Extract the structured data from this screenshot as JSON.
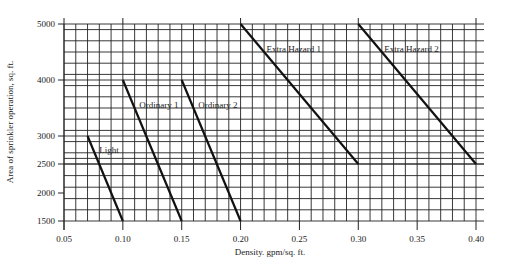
{
  "chart_data": {
    "type": "line",
    "title": "",
    "xlabel": "Density. gpm/sq. ft.",
    "ylabel": "Area of sprinkler operation, sq. ft.",
    "xlim": [
      0.05,
      0.4
    ],
    "ylim": [
      1500,
      5000
    ],
    "x_ticks": [
      "0.05",
      "0.10",
      "0.15",
      "0.20",
      "0.25",
      "0.30",
      "0.35",
      "0.40"
    ],
    "y_ticks": [
      "1500",
      "2000",
      "2500",
      "3000",
      "4000",
      "5000"
    ],
    "grid": true,
    "legend": "none (inline labels)",
    "series": [
      {
        "name": "Light",
        "points": [
          [
            0.07,
            3000
          ],
          [
            0.1,
            1500
          ]
        ],
        "label_at": [
          0.08,
          2700
        ]
      },
      {
        "name": "Ordinary 1",
        "points": [
          [
            0.1,
            4000
          ],
          [
            0.15,
            1500
          ]
        ],
        "label_at": [
          0.114,
          3500
        ]
      },
      {
        "name": "Ordinary 2",
        "points": [
          [
            0.15,
            4000
          ],
          [
            0.2,
            1500
          ]
        ],
        "label_at": [
          0.164,
          3500
        ]
      },
      {
        "name": "Extra Hazard 1",
        "points": [
          [
            0.2,
            5000
          ],
          [
            0.3,
            2500
          ]
        ],
        "label_at": [
          0.222,
          4500
        ]
      },
      {
        "name": "Extra Hazard 2",
        "points": [
          [
            0.3,
            5000
          ],
          [
            0.4,
            2500
          ]
        ],
        "label_at": [
          0.322,
          4500
        ]
      }
    ]
  },
  "colors": {
    "line": "#111111",
    "grid": "#222222",
    "background": "#ffffff"
  }
}
